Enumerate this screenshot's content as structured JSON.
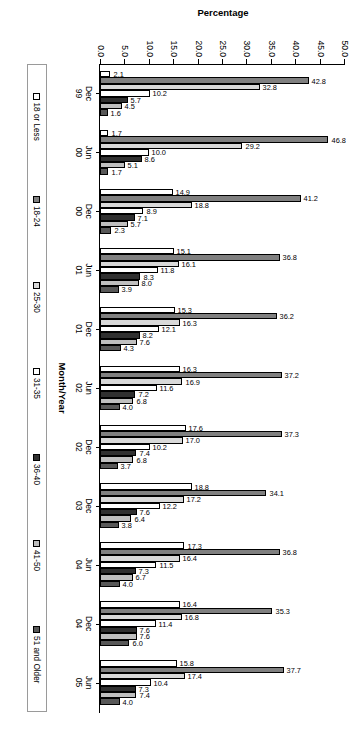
{
  "chart_data": {
    "type": "bar",
    "title": "",
    "xlabel": "Month/Year",
    "ylabel": "Percentage",
    "ylim": [
      0,
      50
    ],
    "ytick_step": 5,
    "yticks": [
      "0.0",
      "5.0",
      "10.0",
      "15.0",
      "20.0",
      "25.0",
      "30.0",
      "35.0",
      "40.0",
      "45.0",
      "50.0"
    ],
    "grid": false,
    "legend_position": "bottom",
    "orientation": "vertical-bars-rotated-90",
    "categories": [
      "Dec\n99",
      "Jun\n00",
      "Dec\n00",
      "Jun\n01",
      "Dec\n01",
      "Jun\n02",
      "Dec\n02",
      "Dec\n03",
      "Jun\n04",
      "Dec\n04",
      "Jun\n05"
    ],
    "category_labels": [
      {
        "month": "Dec",
        "year": "99"
      },
      {
        "month": "Jun",
        "year": "00"
      },
      {
        "month": "Dec",
        "year": "00"
      },
      {
        "month": "Jun",
        "year": "01"
      },
      {
        "month": "Dec",
        "year": "01"
      },
      {
        "month": "Jun",
        "year": "02"
      },
      {
        "month": "Dec",
        "year": "02"
      },
      {
        "month": "Dec",
        "year": "03"
      },
      {
        "month": "Jun",
        "year": "04"
      },
      {
        "month": "Dec",
        "year": "04"
      },
      {
        "month": "Jun",
        "year": "05"
      }
    ],
    "series": [
      {
        "name": "18 or Less",
        "color": "#ffffff",
        "values": [
          2.1,
          1.7,
          14.9,
          15.1,
          15.3,
          16.3,
          17.6,
          18.8,
          17.3,
          16.4,
          15.8
        ]
      },
      {
        "name": "18-24",
        "color": "#808080",
        "values": [
          42.8,
          46.8,
          41.2,
          36.8,
          36.2,
          37.2,
          37.3,
          34.1,
          36.8,
          35.3,
          37.7
        ]
      },
      {
        "name": "25-30",
        "color": "#d9d9d9",
        "values": [
          32.8,
          29.2,
          18.8,
          16.1,
          16.3,
          16.9,
          17.0,
          17.2,
          16.4,
          16.8,
          17.4
        ]
      },
      {
        "name": "31-35",
        "color": "#ffffff",
        "values": [
          10.2,
          10.0,
          8.9,
          11.8,
          12.1,
          11.6,
          10.2,
          12.2,
          11.5,
          11.4,
          10.4
        ]
      },
      {
        "name": "36-40",
        "color": "#303030",
        "values": [
          5.7,
          8.6,
          7.1,
          8.3,
          8.2,
          7.2,
          7.4,
          7.6,
          7.3,
          7.6,
          7.3
        ]
      },
      {
        "name": "41-50",
        "color": "#bfbfbf",
        "values": [
          4.5,
          5.1,
          5.7,
          8.0,
          7.6,
          6.8,
          6.8,
          6.4,
          6.7,
          7.6,
          7.4
        ]
      },
      {
        "name": "51 and Older",
        "color": "#585858",
        "values": [
          1.6,
          1.7,
          2.3,
          3.9,
          4.3,
          4.0,
          3.7,
          3.8,
          4.0,
          6.0,
          4.0
        ]
      }
    ],
    "extra_labels": {
      "dec99_last": "1.7"
    }
  },
  "legend": {
    "items": [
      {
        "label": "18 or Less",
        "swatch": "legend-swatch-18-or-less"
      },
      {
        "label": "18-24",
        "swatch": "legend-swatch-18-24"
      },
      {
        "label": "25-30",
        "swatch": "legend-swatch-25-30"
      },
      {
        "label": "31-35",
        "swatch": "legend-swatch-31-35"
      },
      {
        "label": "36-40",
        "swatch": "legend-swatch-36-40"
      },
      {
        "label": "41-50",
        "swatch": "legend-swatch-41-50"
      },
      {
        "label": "51 and Older",
        "swatch": "legend-swatch-51-and-older"
      }
    ]
  }
}
